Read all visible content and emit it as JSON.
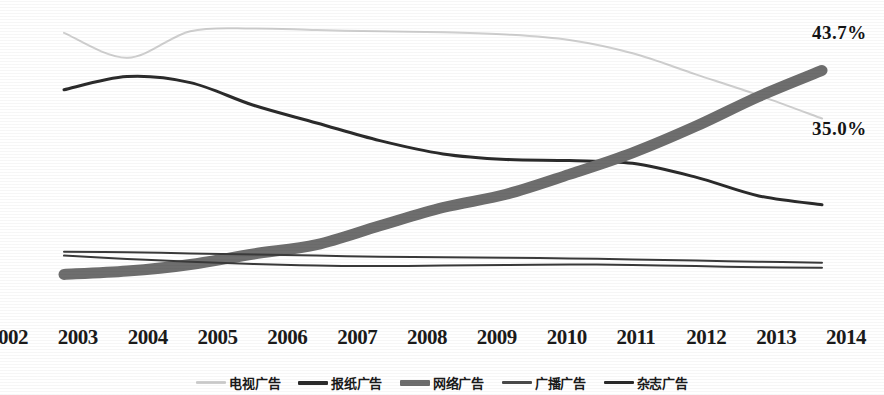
{
  "chart_data": {
    "type": "line",
    "title": "",
    "xlabel": "",
    "ylabel": "",
    "grid": false,
    "legend_position": "bottom",
    "x": [
      2002,
      2003,
      2004,
      2005,
      2006,
      2007,
      2008,
      2009,
      2010,
      2011,
      2012,
      2013,
      2014
    ],
    "xlim": [
      2002,
      2014
    ],
    "ylim": [
      0,
      55
    ],
    "series": [
      {
        "name": "电视广告",
        "color": "#cfcfcf",
        "width": 2,
        "values": [
          50.5,
          46.0,
          50.8,
          51.3,
          51.0,
          50.8,
          50.6,
          50.2,
          49.2,
          46.8,
          43.0,
          39.2,
          35.0
        ]
      },
      {
        "name": "报纸广告",
        "color": "#2b2b2b",
        "width": 3,
        "values": [
          40.2,
          42.6,
          41.5,
          37.4,
          34.2,
          31.0,
          28.6,
          27.6,
          27.4,
          26.9,
          24.4,
          21.0,
          19.4
        ]
      },
      {
        "name": "网络广告",
        "color": "#6e6e6e",
        "width": 11,
        "values": [
          6.8,
          7.4,
          8.6,
          10.5,
          12.2,
          15.6,
          18.9,
          21.3,
          24.9,
          28.8,
          33.6,
          39.0,
          43.7
        ]
      },
      {
        "name": "广播广告",
        "color": "#3a3a3a",
        "width": 2,
        "values": [
          10.9,
          10.8,
          10.6,
          10.4,
          10.2,
          10.0,
          9.9,
          9.8,
          9.7,
          9.5,
          9.3,
          9.1,
          8.9
        ]
      },
      {
        "name": "杂志广告",
        "color": "#3a3a3a",
        "width": 2,
        "values": [
          10.2,
          9.6,
          9.1,
          8.7,
          8.4,
          8.3,
          8.4,
          8.5,
          8.6,
          8.5,
          8.3,
          8.1,
          8.0
        ]
      }
    ],
    "annotations": [
      {
        "text": "43.7%",
        "series": "网络广告",
        "x": 2014
      },
      {
        "text": "35.0%",
        "series": "电视广告",
        "x": 2014
      }
    ]
  },
  "axis": {
    "tick_labels": [
      "2002",
      "2003",
      "2004",
      "2005",
      "2006",
      "2007",
      "2008",
      "2009",
      "2010",
      "2011",
      "2012",
      "2013",
      "2014"
    ]
  },
  "legend": {
    "items": [
      {
        "label": "电视广告",
        "color": "#cfcfcf",
        "thickness": 3
      },
      {
        "label": "报纸广告",
        "color": "#2b2b2b",
        "thickness": 4
      },
      {
        "label": "网络广告",
        "color": "#6e6e6e",
        "thickness": 6
      },
      {
        "label": "广播广告",
        "color": "#4a4a4a",
        "thickness": 3
      },
      {
        "label": "杂志广告",
        "color": "#2b2b2b",
        "thickness": 3
      }
    ]
  },
  "annotations": {
    "internet_end": "43.7%",
    "tv_end": "35.0%"
  },
  "colors": {
    "tv": "#cfcfcf",
    "newspaper": "#2b2b2b",
    "internet": "#6e6e6e",
    "radio": "#3a3a3a",
    "magazine": "#3a3a3a",
    "text": "#1b1b1b",
    "background": "#ffffff"
  }
}
